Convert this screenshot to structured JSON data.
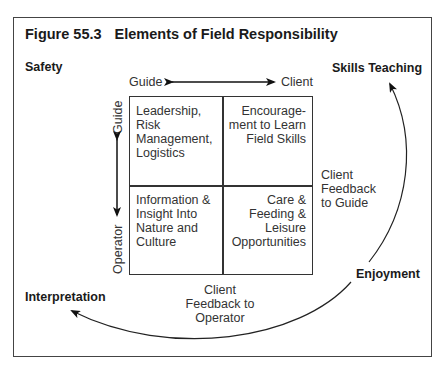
{
  "figure": {
    "number": "Figure 55.3",
    "title": "Elements of Field Responsibility"
  },
  "corners": {
    "top_left": "Safety",
    "top_right": "Skills Teaching",
    "bottom_right": "Enjoyment",
    "bottom_left": "Interpretation"
  },
  "axes": {
    "horizontal": {
      "left": "Guide",
      "right": "Client"
    },
    "vertical": {
      "top": "Guide",
      "bottom": "Operator"
    }
  },
  "quadrants": {
    "top_left": [
      "Leadership,",
      "Risk",
      "Management,",
      "Logistics"
    ],
    "top_right": [
      "Encourage-",
      "ment to Learn",
      "Field Skills"
    ],
    "bottom_left": [
      "Information &",
      "Insight Into",
      "Nature and",
      "Culture"
    ],
    "bottom_right": [
      "Care &",
      "Feeding &",
      "Leisure",
      "Opportunities"
    ]
  },
  "feedback": {
    "to_guide": [
      "Client",
      "Feedback",
      "to Guide"
    ],
    "to_operator": [
      "Client",
      "Feedback to",
      "Operator"
    ]
  }
}
